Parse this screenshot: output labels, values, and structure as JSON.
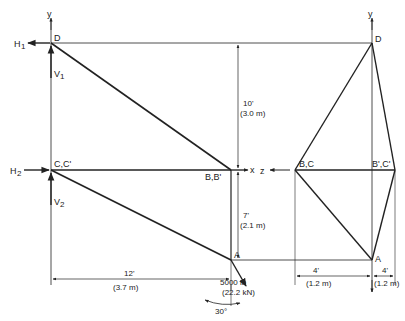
{
  "diagram": {
    "type": "tripod truss front and side view",
    "colors": {
      "line": "#222222",
      "background": "#ffffff"
    },
    "front_view": {
      "nodes": {
        "D": "D",
        "C": "C,C'",
        "B": "B,B'",
        "A": "A"
      },
      "reactions": {
        "H1": "H",
        "H1_sub": "1",
        "V1": "V",
        "V1_sub": "1",
        "H2": "H",
        "H2_sub": "2",
        "V2": "V",
        "V2_sub": "2"
      },
      "axes": {
        "y": "y",
        "x": "x"
      },
      "load": {
        "value": "5000 lb",
        "metric": "(22.2 kN)",
        "angle": "30°"
      },
      "dimensions": {
        "horizontal": {
          "imperial": "12'",
          "metric": "(3.7 m)"
        },
        "upper_vertical": {
          "imperial": "10'",
          "metric": "(3.0 m)"
        },
        "lower_vertical": {
          "imperial": "7'",
          "metric": "(2.1 m)"
        }
      }
    },
    "side_view": {
      "nodes": {
        "D": "D",
        "BC": "B,C",
        "BpCp": "B',C'",
        "A": "A"
      },
      "axes": {
        "y": "y",
        "z": "z"
      },
      "dimensions": {
        "left": {
          "imperial": "4'",
          "metric": "(1.2 m)"
        },
        "right": {
          "imperial": "4'",
          "metric": "(1.2 m)"
        }
      }
    }
  }
}
